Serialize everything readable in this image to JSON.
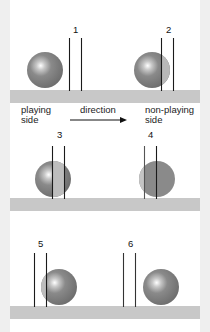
{
  "colors": {
    "background": "#efefef",
    "panel": "#ffffff",
    "ground": "#c8c8c8",
    "ball": "#7a7a7a",
    "ball_highlight": "#ffffff",
    "ball_overlap_light": "#b4b4b4",
    "line": "#1a1a1a"
  },
  "labels": {
    "playing_side_line1": "playing",
    "playing_side_line2": "side",
    "direction": "direction",
    "non_playing_side_line1": "non-playing",
    "non_playing_side_line2": "side"
  },
  "steps": [
    {
      "number": "1",
      "description": "ball before entering wicket"
    },
    {
      "number": "2",
      "description": "ball partially through wicket, front edge past first wire"
    },
    {
      "number": "3",
      "description": "ball centered between wires"
    },
    {
      "number": "4",
      "description": "ball mostly through wicket"
    },
    {
      "number": "5",
      "description": "ball touching far wire"
    },
    {
      "number": "6",
      "description": "ball fully clear of wicket"
    }
  ]
}
